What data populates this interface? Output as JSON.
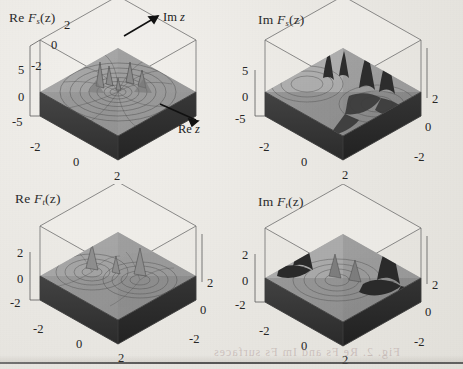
{
  "figure": {
    "type": "grid-of-3d-surface-plots",
    "rows": 2,
    "cols": 2,
    "rendering": "grayscale scanned book figure",
    "colors": {
      "page_background": "#e9e7e2",
      "surface_top": "#9a9a9a",
      "surface_top_light": "#b4b4b4",
      "surface_side_dark": "#3a3a3a",
      "contour_line": "#4a4a4a",
      "axis_line": "#3d3d3d",
      "text": "#1f1f1f"
    }
  },
  "axis_arrows": {
    "imaginary": "Im z",
    "real": "Re z"
  },
  "panels": [
    {
      "id": "top-left",
      "label_prefix": "Re",
      "label_function": "F",
      "label_subscript": "s",
      "label_arg": "(z)",
      "label_full": "Re Fs(z)",
      "orientation": "left-handed",
      "has_axis_arrows": true,
      "vertical_axis": {
        "ticks": [
          "5",
          "0",
          "-5"
        ],
        "range": [
          -5,
          5
        ]
      },
      "depth_axis": {
        "ticks": [
          "2",
          "0",
          "-2"
        ],
        "range": [
          -2,
          2
        ]
      },
      "bottom_axis": {
        "ticks": [
          "-2",
          "0",
          "2"
        ],
        "range": [
          -2,
          2
        ]
      },
      "right_axis": {
        "ticks": [],
        "range": [
          -2,
          2
        ]
      }
    },
    {
      "id": "top-right",
      "label_prefix": "Im",
      "label_function": "F",
      "label_subscript": "s",
      "label_arg": "(z)",
      "label_full": "Im Fs(z)",
      "orientation": "right-handed",
      "has_axis_arrows": false,
      "vertical_axis": {
        "ticks": [
          "5",
          "0",
          "-5"
        ],
        "range": [
          -5,
          5
        ]
      },
      "depth_axis": {
        "ticks": [],
        "range": [
          -2,
          2
        ]
      },
      "bottom_axis": {
        "ticks": [
          "-2",
          "0",
          "2"
        ],
        "range": [
          -2,
          2
        ]
      },
      "right_axis": {
        "ticks": [
          "2",
          "0",
          "-2"
        ],
        "range": [
          -2,
          2
        ]
      }
    },
    {
      "id": "bottom-left",
      "label_prefix": "Re",
      "label_function": "F",
      "label_subscript": "t",
      "label_arg": "(z)",
      "label_full": "Re Ft(z)",
      "orientation": "right-handed",
      "has_axis_arrows": false,
      "vertical_axis": {
        "ticks": [
          "2",
          "0",
          "-2"
        ],
        "range": [
          -2,
          2
        ]
      },
      "depth_axis": {
        "ticks": [],
        "range": [
          -2,
          2
        ]
      },
      "bottom_axis": {
        "ticks": [
          "-2",
          "0",
          "2"
        ],
        "range": [
          -2,
          2
        ]
      },
      "right_axis": {
        "ticks": [
          "2",
          "0",
          "-2"
        ],
        "range": [
          -2,
          2
        ]
      }
    },
    {
      "id": "bottom-right",
      "label_prefix": "Im",
      "label_function": "F",
      "label_subscript": "t",
      "label_arg": "(z)",
      "label_full": "Im Ft(z)",
      "orientation": "right-handed",
      "has_axis_arrows": false,
      "vertical_axis": {
        "ticks": [
          "2",
          "0",
          "-2"
        ],
        "range": [
          -2,
          2
        ]
      },
      "depth_axis": {
        "ticks": [],
        "range": [
          -2,
          2
        ]
      },
      "bottom_axis": {
        "ticks": [
          "-2",
          "0",
          "2"
        ],
        "range": [
          -2,
          2
        ]
      },
      "right_axis": {
        "ticks": [
          "2",
          "0",
          "-2"
        ],
        "range": [
          -2,
          2
        ]
      }
    }
  ],
  "bleed_through": {
    "visible": true,
    "text": "Fig. 2.  Re Fs  and  Im Fs  surfaces"
  }
}
